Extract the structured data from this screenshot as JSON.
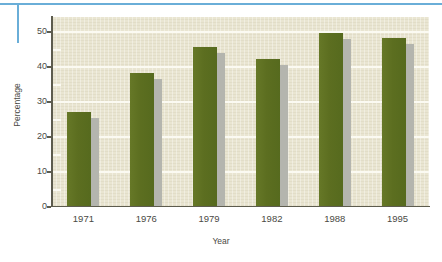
{
  "chart_data": {
    "type": "bar",
    "title": "",
    "subtitle": "",
    "xlabel": "Year",
    "ylabel": "Percentage",
    "categories": [
      "1971",
      "1976",
      "1979",
      "1982",
      "1988",
      "1995"
    ],
    "values": [
      27,
      38,
      45.5,
      42,
      49.5,
      48
    ],
    "series": [
      {
        "name": "Percentage",
        "values": [
          27,
          38,
          45.5,
          42,
          49.5,
          48
        ]
      }
    ],
    "ylim": [
      0,
      54
    ],
    "xlim": [
      0,
      6
    ],
    "ytick_labels": [
      "0",
      "10",
      "20",
      "30",
      "40",
      "50"
    ],
    "ytick_values": [
      0,
      10,
      20,
      30,
      40,
      50
    ],
    "yminor_tick_values": [
      5,
      15,
      25,
      35,
      45
    ],
    "xtick_labels": [
      "1971",
      "1976",
      "1979",
      "1982",
      "1988",
      "1995"
    ],
    "grid": true,
    "grid_axis": "y",
    "legend": false,
    "legend_position": "none",
    "annotations": [],
    "colors": {
      "bar": "#5f7022",
      "bar_shadow": "#b4b5ae",
      "plot_background": "#e9e5d1",
      "gridline": "#fbfaf2",
      "axis_line": "#5d5c4e",
      "tick_label": "#4a4a44",
      "page_rule": "#6aaed8",
      "page_background": "#ffffff"
    }
  },
  "decorations": {
    "top_rule_name": "top-horizontal-rule",
    "left_rule_name": "left-vertical-rule"
  }
}
